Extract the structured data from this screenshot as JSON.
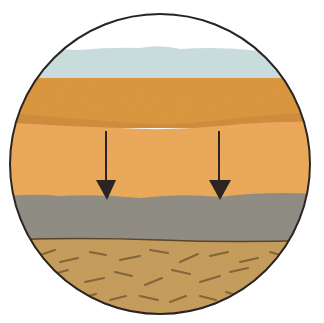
{
  "diagram": {
    "type": "soil-cross-section",
    "shape": "circle",
    "layers": [
      {
        "name": "sky",
        "color": "#ffffff"
      },
      {
        "name": "surface-water-haze",
        "color": "#c9dcdc"
      },
      {
        "name": "topsoil",
        "color": "#d9963f"
      },
      {
        "name": "topsoil-dark-band",
        "color": "#cf8a3c"
      },
      {
        "name": "sand-layer",
        "color": "#eaa95a"
      },
      {
        "name": "clay-layer",
        "color": "#8f8c84"
      },
      {
        "name": "bedrock",
        "color": "#c49c5c"
      }
    ],
    "arrows": [
      {
        "name": "downward-flow-arrow-left",
        "x": 106,
        "direction": "down"
      },
      {
        "name": "downward-flow-arrow-right",
        "x": 219,
        "direction": "down"
      }
    ],
    "outline_color": "#2a2522"
  }
}
